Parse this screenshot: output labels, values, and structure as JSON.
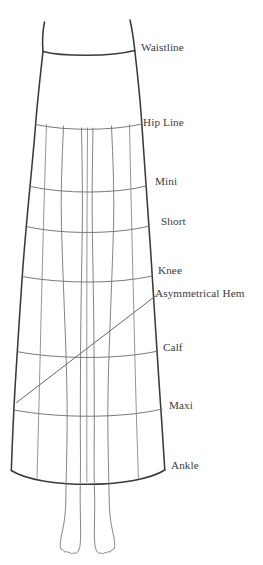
{
  "diagram": {
    "stroke_color": "#3a3a3a",
    "guide_color": "#6a6a6a",
    "background_color": "#ffffff",
    "labels": [
      {
        "id": "waistline",
        "text": "Waistline",
        "x": 141,
        "y": 41,
        "line_y": 52
      },
      {
        "id": "hip-line",
        "text": "Hip Line",
        "x": 143,
        "y": 116,
        "line_y": 124
      },
      {
        "id": "mini",
        "text": "Mini",
        "x": 155,
        "y": 175,
        "line_y": 187
      },
      {
        "id": "short",
        "text": "Short",
        "x": 161,
        "y": 215,
        "line_y": 227
      },
      {
        "id": "knee",
        "text": "Knee",
        "x": 158,
        "y": 264,
        "line_y": 276
      },
      {
        "id": "asymmetrical-hem",
        "text": "Asymmetrical Hem",
        "x": 155,
        "y": 287,
        "line_y": 296
      },
      {
        "id": "calf",
        "text": "Calf",
        "x": 163,
        "y": 341,
        "line_y": 352
      },
      {
        "id": "maxi",
        "text": "Maxi",
        "x": 169,
        "y": 399,
        "line_y": 410
      },
      {
        "id": "ankle",
        "text": "Ankle",
        "x": 171,
        "y": 459,
        "line_y": 470
      }
    ]
  }
}
